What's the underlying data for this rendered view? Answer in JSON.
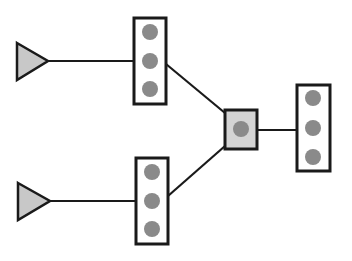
{
  "diagram": {
    "colors": {
      "stroke": "#1a1a1a",
      "triangle_fill": "#c8c8c8",
      "hub_fill": "#d4d4d4",
      "box_fill": "#ffffff",
      "dot_fill": "#8a8a8a",
      "background": "#ffffff"
    },
    "sources": [
      {
        "id": "source-top",
        "shape": "triangle",
        "points": "17,43 48,61 17,80"
      },
      {
        "id": "source-bottom",
        "shape": "triangle",
        "points": "18,183 50,201 18,220"
      }
    ],
    "stacks": [
      {
        "id": "stack-top",
        "x": 134,
        "y": 18,
        "w": 32,
        "h": 86,
        "dots": [
          {
            "cx": 150,
            "cy": 32
          },
          {
            "cx": 150,
            "cy": 61
          },
          {
            "cx": 150,
            "cy": 89
          }
        ]
      },
      {
        "id": "stack-bottom",
        "x": 136,
        "y": 158,
        "w": 32,
        "h": 86,
        "dots": [
          {
            "cx": 152,
            "cy": 172
          },
          {
            "cx": 152,
            "cy": 201
          },
          {
            "cx": 152,
            "cy": 229
          }
        ]
      },
      {
        "id": "stack-right",
        "x": 297,
        "y": 85,
        "w": 33,
        "h": 86,
        "dots": [
          {
            "cx": 313,
            "cy": 98
          },
          {
            "cx": 313,
            "cy": 128
          },
          {
            "cx": 313,
            "cy": 157
          }
        ]
      }
    ],
    "hub": {
      "id": "hub",
      "x": 225,
      "y": 110,
      "w": 32,
      "h": 39,
      "dot": {
        "cx": 241,
        "cy": 129
      }
    },
    "edges": [
      {
        "id": "edge-source-top-to-stack-top",
        "x1": 48,
        "y1": 61,
        "x2": 134,
        "y2": 61
      },
      {
        "id": "edge-source-bottom-to-stack-bottom",
        "x1": 50,
        "y1": 201,
        "x2": 136,
        "y2": 201
      },
      {
        "id": "edge-stack-top-to-hub",
        "x1": 166,
        "y1": 64,
        "x2": 225,
        "y2": 113
      },
      {
        "id": "edge-stack-bottom-to-hub",
        "x1": 168,
        "y1": 196,
        "x2": 225,
        "y2": 146
      },
      {
        "id": "edge-hub-to-stack-right",
        "x1": 257,
        "y1": 130,
        "x2": 297,
        "y2": 130
      }
    ],
    "dot_radius": 8
  }
}
